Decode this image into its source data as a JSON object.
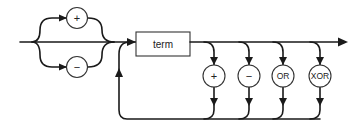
{
  "diagram": {
    "type": "syntax-railroad-diagram",
    "sign_options": [
      {
        "id": "plus",
        "label": "+"
      },
      {
        "id": "minus",
        "label": "−"
      }
    ],
    "term_box": {
      "label": "term"
    },
    "operators": [
      {
        "id": "plus",
        "label": "+"
      },
      {
        "id": "minus",
        "label": "−"
      },
      {
        "id": "or",
        "label": "OR"
      },
      {
        "id": "xor",
        "label": "XOR"
      }
    ],
    "colors": {
      "line": "#1a1a1a",
      "node_stroke": "#333333",
      "background": "#ffffff"
    }
  }
}
